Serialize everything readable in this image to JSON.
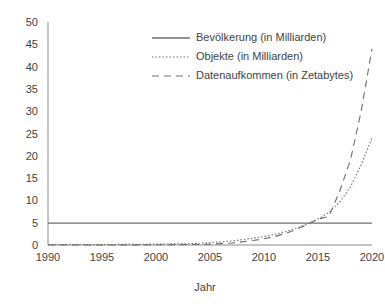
{
  "chart_data": {
    "type": "line",
    "title": "",
    "xlabel": "Jahr",
    "ylabel": "",
    "xlim": [
      1990,
      2020
    ],
    "ylim": [
      0,
      50
    ],
    "grid": false,
    "legend_position": "top-center",
    "x_ticks": [
      1990,
      1995,
      2000,
      2005,
      2010,
      2015,
      2020
    ],
    "y_ticks": [
      0,
      5,
      10,
      15,
      20,
      25,
      30,
      35,
      40,
      45,
      50
    ],
    "x": [
      1990,
      1995,
      2000,
      2003,
      2005,
      2006,
      2007,
      2008,
      2009,
      2010,
      2011,
      2012,
      2013,
      2014,
      2015,
      2016,
      2017,
      2018,
      2019,
      2020
    ],
    "series": [
      {
        "name": "Bevölkerung (in Milliarden)",
        "style": "solid",
        "color": "#6f6f6f",
        "values": [
          4.9,
          4.9,
          4.9,
          4.9,
          4.9,
          4.9,
          4.9,
          4.9,
          4.9,
          4.9,
          4.9,
          4.9,
          4.9,
          4.9,
          4.9,
          4.9,
          4.9,
          4.9,
          4.9,
          4.9
        ]
      },
      {
        "name": "Objekte (in Milliarden)",
        "style": "dotted",
        "color": "#6f6f6f",
        "values": [
          0.1,
          0.1,
          0.2,
          0.3,
          0.5,
          0.7,
          0.9,
          1.2,
          1.5,
          1.9,
          2.4,
          3.0,
          3.8,
          4.7,
          5.8,
          7.3,
          9.6,
          13.0,
          18.0,
          24.0
        ]
      },
      {
        "name": "Datenaufkommen (in Zetabytes)",
        "style": "dashed",
        "color": "#6f6f6f",
        "values": [
          0.0,
          0.0,
          0.05,
          0.1,
          0.2,
          0.3,
          0.45,
          0.7,
          1.0,
          1.4,
          1.9,
          2.6,
          3.5,
          4.6,
          5.8,
          6.4,
          12.0,
          19.0,
          30.0,
          44.0
        ]
      }
    ]
  },
  "axis": {
    "x_tick_labels": [
      "1990",
      "1995",
      "2000",
      "2005",
      "2010",
      "2015",
      "2020"
    ],
    "y_tick_labels": [
      "0",
      "5",
      "10",
      "15",
      "20",
      "25",
      "30",
      "35",
      "40",
      "45",
      "50"
    ],
    "x_axis_title": "Jahr"
  },
  "legend": {
    "entries": [
      {
        "label": "Bevölkerung (in Milliarden)"
      },
      {
        "label": "Objekte (in Milliarden)"
      },
      {
        "label": "Datenaufkommen (in Zetabytes)"
      }
    ]
  },
  "colors": {
    "axis": "#8a8a8a",
    "series": "#6f6f6f",
    "text": "#3f3f3f",
    "background": "#ffffff"
  }
}
